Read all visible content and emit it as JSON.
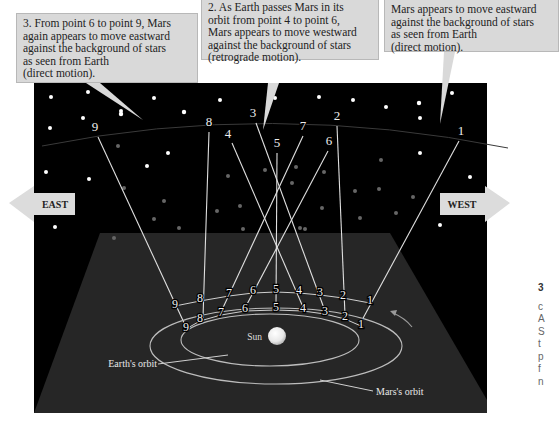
{
  "callouts": {
    "left": {
      "lines": [
        "3. From point 6 to point 9, Mars",
        "again appears to move eastward",
        "against the background of stars",
        "as seen from Earth",
        "(direct motion)."
      ]
    },
    "middle": {
      "lines": [
        "2. As Earth passes Mars in its",
        "orbit from point 4 to point 6,",
        "Mars appears to move westward",
        "against the background of stars",
        "(retrograde motion)."
      ]
    },
    "right": {
      "lines": [
        "Mars appears to move eastward",
        "against the background of stars",
        "as seen from Earth",
        "(direct motion)."
      ]
    }
  },
  "arrows": {
    "east": "EAST",
    "west": "WEST"
  },
  "labels": {
    "sun": "Sun",
    "earth_orbit": "Earth's orbit",
    "mars_orbit": "Mars's orbit"
  },
  "sky_points": [
    {
      "n": "9",
      "x": 95,
      "y": 131
    },
    {
      "n": "8",
      "x": 209,
      "y": 126
    },
    {
      "n": "3",
      "x": 253,
      "y": 117
    },
    {
      "n": "4",
      "x": 228,
      "y": 138
    },
    {
      "n": "5",
      "x": 277,
      "y": 147
    },
    {
      "n": "7",
      "x": 303,
      "y": 130
    },
    {
      "n": "2",
      "x": 337,
      "y": 120
    },
    {
      "n": "6",
      "x": 329,
      "y": 145
    },
    {
      "n": "1",
      "x": 461,
      "y": 135
    }
  ],
  "mars_points": [
    {
      "n": "9",
      "x": 175,
      "y": 308
    },
    {
      "n": "8",
      "x": 200,
      "y": 302
    },
    {
      "n": "7",
      "x": 229,
      "y": 297
    },
    {
      "n": "6",
      "x": 253,
      "y": 294
    },
    {
      "n": "5",
      "x": 276,
      "y": 293
    },
    {
      "n": "4",
      "x": 299,
      "y": 294
    },
    {
      "n": "3",
      "x": 320,
      "y": 296
    },
    {
      "n": "2",
      "x": 343,
      "y": 299
    },
    {
      "n": "1",
      "x": 370,
      "y": 304
    }
  ],
  "earth_points": [
    {
      "n": "9",
      "x": 186,
      "y": 331
    },
    {
      "n": "8",
      "x": 200,
      "y": 322
    },
    {
      "n": "7",
      "x": 221,
      "y": 316
    },
    {
      "n": "6",
      "x": 245,
      "y": 312
    },
    {
      "n": "5",
      "x": 276,
      "y": 311
    },
    {
      "n": "4",
      "x": 303,
      "y": 312
    },
    {
      "n": "3",
      "x": 325,
      "y": 315
    },
    {
      "n": "2",
      "x": 345,
      "y": 320
    },
    {
      "n": "1",
      "x": 361,
      "y": 328
    }
  ],
  "edge_text": [
    "3",
    "c",
    "A",
    "S",
    "t",
    "p",
    "f",
    "n"
  ]
}
